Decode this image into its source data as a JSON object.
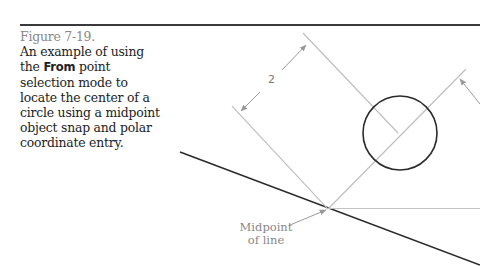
{
  "figure": {
    "number": "Figure 7-19.",
    "caption_pre": "An example of using the ",
    "caption_bold": "From",
    "caption_post": " point selection mode to locate the center of a circle using a midpoint object snap and polar coordinate entry."
  },
  "drawing": {
    "dimension_value": "2",
    "callout_line1": "Midpoint",
    "callout_line2": "of line",
    "colors": {
      "object_line": "#2a2a2a",
      "construction_line": "#bdbdbd",
      "dimension": "#9a9a9a",
      "label": "#888888"
    }
  }
}
